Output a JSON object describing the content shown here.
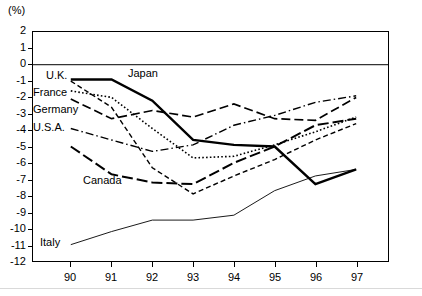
{
  "figure": {
    "unit_label": "(%)",
    "y_axis": {
      "min": -12,
      "max": 2,
      "step": 1,
      "ticks": [
        "2",
        "1",
        "0",
        "-1",
        "-2",
        "-3",
        "-4",
        "-5",
        "-6",
        "-7",
        "-8",
        "-9",
        "-10",
        "-11",
        "-12"
      ]
    },
    "x_axis": {
      "ticks": [
        "90",
        "91",
        "92",
        "93",
        "94",
        "95",
        "96",
        "97"
      ]
    },
    "zero_line": 0,
    "grid": false,
    "legend_position": "inline-labels"
  },
  "chart_data": {
    "type": "line",
    "title": "",
    "subtitle": "",
    "xlabel": "",
    "ylabel": "(%)",
    "xlim": [
      90,
      97
    ],
    "ylim": [
      -12,
      2
    ],
    "x": [
      "90",
      "91",
      "92",
      "93",
      "94",
      "95",
      "96",
      "97"
    ],
    "grid": false,
    "legend_position": "inline-labels",
    "annotations": [
      "(%)"
    ],
    "series": [
      {
        "name": "Japan",
        "style": "thick-solid",
        "color": "#000000",
        "label_x": "93.0",
        "values": [
          -0.9,
          -0.9,
          -2.2,
          -4.6,
          -4.9,
          -5.0,
          -7.3,
          -6.4
        ]
      },
      {
        "name": "U.K.",
        "style": "dashed",
        "color": "#000000",
        "label_x": "90.1",
        "values": [
          -1.0,
          -2.6,
          -6.3,
          -7.9,
          -6.8,
          -5.8,
          -4.6,
          -3.6
        ]
      },
      {
        "name": "France",
        "style": "dotted",
        "color": "#000000",
        "label_x": "90.1",
        "values": [
          -1.6,
          -2.0,
          -3.9,
          -5.7,
          -5.6,
          -4.9,
          -4.1,
          -3.2
        ]
      },
      {
        "name": "Germany",
        "style": "long-dash",
        "color": "#000000",
        "label_x": "90.1",
        "values": [
          -2.1,
          -3.3,
          -2.8,
          -3.2,
          -2.4,
          -3.3,
          -3.4,
          -2.0
        ]
      },
      {
        "name": "U.S.A.",
        "style": "dash-dot",
        "color": "#000000",
        "label_x": "90.1",
        "values": [
          -3.9,
          -4.6,
          -5.3,
          -4.9,
          -3.7,
          -3.1,
          -2.3,
          -1.9
        ]
      },
      {
        "name": "Canada",
        "style": "heavy-long-dash",
        "color": "#000000",
        "label_x": "91.0",
        "values": [
          -5.0,
          -6.7,
          -7.2,
          -7.3,
          -6.0,
          -5.0,
          -3.7,
          -3.3
        ]
      },
      {
        "name": "Italy",
        "style": "thin-solid",
        "color": "#000000",
        "label_x": "90.1",
        "values": [
          -11.0,
          -10.2,
          -9.5,
          -9.5,
          -9.2,
          -7.7,
          -6.8,
          -6.4
        ]
      }
    ]
  },
  "inline_labels": [
    {
      "text": "U.K.",
      "left": 46,
      "top": 70
    },
    {
      "text": "Japan",
      "left": 128,
      "top": 68
    },
    {
      "text": "France",
      "left": 33,
      "top": 87
    },
    {
      "text": "Germany",
      "left": 33,
      "top": 104
    },
    {
      "text": "U.S.A.",
      "left": 33,
      "top": 122
    },
    {
      "text": "Canada",
      "left": 83,
      "top": 175
    },
    {
      "text": "Italy",
      "left": 40,
      "top": 237
    }
  ]
}
